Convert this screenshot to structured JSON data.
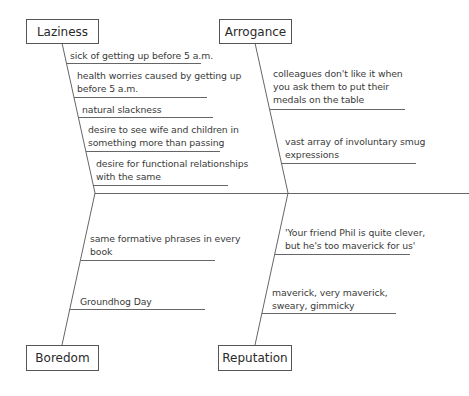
{
  "diagram": {
    "type": "fishbone",
    "categories": {
      "laziness": {
        "label": "Laziness",
        "causes": [
          "sick of getting up before 5 a.m.",
          "health worries caused by getting up\nbefore 5 a.m.",
          "natural slackness",
          "desire to see wife and children in\nsomething more than passing",
          "desire for functional relationships\nwith the same"
        ]
      },
      "arrogance": {
        "label": "Arrogance",
        "causes": [
          "colleagues don't like it when\nyou ask them to put their\nmedals on the table",
          "vast array of involuntary smug\nexpressions"
        ]
      },
      "boredom": {
        "label": "Boredom",
        "causes": [
          "same formative phrases in every\nbook",
          "Groundhog Day"
        ]
      },
      "reputation": {
        "label": "Reputation",
        "causes": [
          "'Your friend Phil is quite clever,\nbut he's too maverick for us'",
          "maverick, very maverick,\nsweary, gimmicky"
        ]
      }
    },
    "colors": {
      "line": "#555555",
      "text": "#333333"
    }
  }
}
